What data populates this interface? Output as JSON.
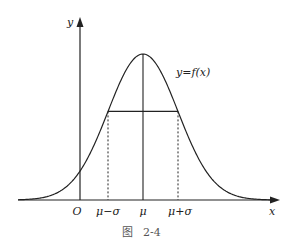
{
  "figure": {
    "caption_prefix": "图",
    "caption_number": "2-4",
    "curve_label": "y=f(x)",
    "x_axis_label": "x",
    "y_axis_label": "y",
    "origin_label": "O",
    "tick_labels": {
      "mu_minus_sigma": "μ−σ",
      "mu": "μ",
      "mu_plus_sigma": "μ+σ"
    }
  },
  "chart_data": {
    "type": "line",
    "title": "图 2-4",
    "xlabel": "x",
    "ylabel": "y",
    "x_ticks": [
      "O",
      "μ−σ",
      "μ",
      "μ+σ"
    ],
    "series": [
      {
        "name": "y=f(x)",
        "function": "normal density",
        "mean": "μ",
        "std": "σ"
      }
    ],
    "annotations": [
      "y=f(x)"
    ],
    "grid": false
  }
}
